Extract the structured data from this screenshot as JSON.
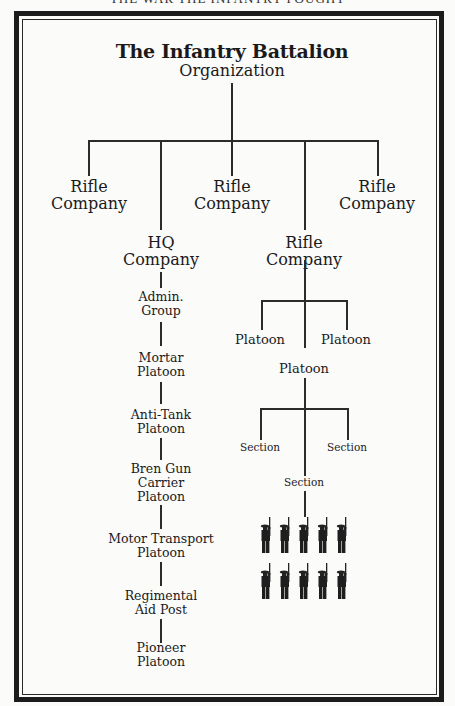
{
  "page": {
    "running_head": "THE WAR THE INFANTRY FOUGHT"
  },
  "chart": {
    "title": "The Infantry Battalion",
    "subtitle": "Organization",
    "companies": [
      {
        "line1": "Rifle",
        "line2": "Company"
      },
      {
        "line1": "Rifle",
        "line2": "Company"
      },
      {
        "line1": "Rifle",
        "line2": "Company"
      }
    ],
    "hq_company": {
      "line1": "HQ",
      "line2": "Company",
      "units": [
        [
          "Admin.",
          "Group"
        ],
        [
          "Mortar",
          "Platoon"
        ],
        [
          "Anti-Tank",
          "Platoon"
        ],
        [
          "Bren Gun",
          "Carrier",
          "Platoon"
        ],
        [
          "Motor Transport",
          "Platoon"
        ],
        [
          "Regimental",
          "Aid Post"
        ],
        [
          "Pioneer",
          "Platoon"
        ]
      ]
    },
    "rifle_company": {
      "line1": "Rifle",
      "line2": "Company",
      "platoons": [
        "Platoon",
        "Platoon",
        "Platoon"
      ],
      "sections": [
        "Section",
        "Section",
        "Section"
      ],
      "soldiers": {
        "rows": 2,
        "per_row": 5,
        "icon": "soldier-with-rifle-icon"
      }
    }
  }
}
